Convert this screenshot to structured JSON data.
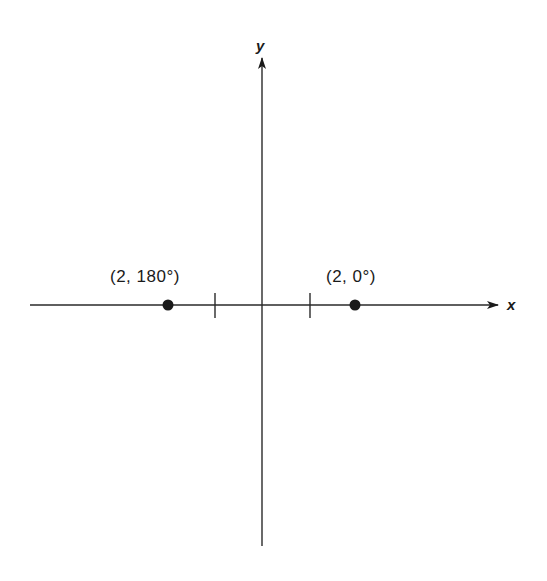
{
  "diagram": {
    "title": "",
    "axes": {
      "x_label": "x",
      "y_label": "y",
      "origin": {
        "px": 262,
        "py": 305
      },
      "x_axis": {
        "x1": 30,
        "x2": 498
      },
      "y_axis": {
        "y1": 58,
        "y2": 546
      }
    },
    "ticks": [
      {
        "name": "tick-neg-1",
        "px": 215
      },
      {
        "name": "tick-pos-1",
        "px": 310
      }
    ],
    "points": [
      {
        "name": "point-2-180",
        "label": "(2, 180°)",
        "r": 2,
        "theta_deg": 180,
        "px": 168,
        "py": 305,
        "label_x": 110,
        "label_y": 282
      },
      {
        "name": "point-2-0",
        "label": "(2, 0°)",
        "r": 2,
        "theta_deg": 0,
        "px": 355,
        "py": 305,
        "label_x": 326,
        "label_y": 282
      }
    ],
    "colors": {
      "ink": "#1a1a1a",
      "background": "#ffffff"
    }
  }
}
